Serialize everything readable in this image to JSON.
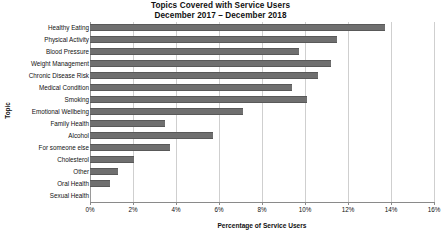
{
  "chart_data": {
    "type": "bar",
    "orientation": "horizontal",
    "title": "Topics Covered with Service Users",
    "subtitle": "December 2017 – December 2018",
    "title_lines": [
      "Topics Covered with Service Users",
      "December 2017 – December 2018"
    ],
    "xlabel": "Percentage of Service Users",
    "ylabel": "Topic",
    "categories": [
      "Healthy Eating",
      "Physical Activity",
      "Blood Pressure",
      "Weight Management",
      "Chronic Disease Risk",
      "Medical Condition",
      "Smoking",
      "Emotional Wellbeing",
      "Family Health",
      "Alcohol",
      "For someone else",
      "Cholesterol",
      "Other",
      "Oral Health",
      "Sexual Health"
    ],
    "values": [
      13.7,
      11.5,
      9.7,
      11.2,
      10.6,
      9.4,
      10.1,
      7.1,
      3.5,
      5.7,
      3.7,
      2.05,
      1.3,
      0.95,
      0.0
    ],
    "xlim": [
      0,
      16
    ],
    "xtick_values": [
      0,
      2,
      4,
      6,
      8,
      10,
      12,
      14,
      16
    ],
    "xtick_labels": [
      "0%",
      "2%",
      "4%",
      "6%",
      "8%",
      "10%",
      "12%",
      "14%",
      "16%"
    ],
    "grid": "vertical",
    "legend": "none",
    "bar_color": "#6f6f6f",
    "bar_edge_color": "#595959",
    "gridline_color": "#cfcfcf",
    "axis_color": "#8a8a8a",
    "background_color": "#ffffff",
    "value_unit": "percent"
  }
}
